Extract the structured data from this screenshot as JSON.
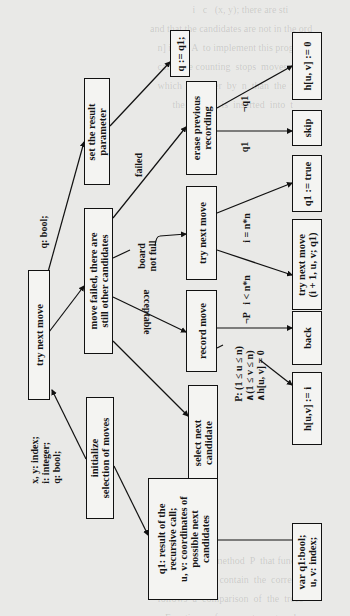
{
  "diagram": {
    "declarations": {
      "root_params": "q: bool;",
      "root_locals": "x, y: index;\ni: integer;\nq: bool;",
      "var_block": "var q1:bool;\nu, v: index;"
    },
    "nodes": {
      "root": "try next move",
      "init": "initialize\nselection of moves",
      "loop": "move failed, there are\nstill other candidates",
      "set_result": "set the result\nparameter",
      "assign_q": "q := q1;",
      "select": "select next\ncandidate",
      "record": "record move",
      "try_inner": "try next move",
      "erase": "erase previous\nrecording",
      "q1_note": "q1: result of the\nrecursive call;\nu, v: coordinates of\npossible next\ncandidates",
      "h_zero": "h[u, v] := 0",
      "skip": "skip",
      "q1_true": "q1 := true",
      "try_recursive": "try next move\n(i + 1, u, v; q1)",
      "back": "back",
      "h_assign": "h[u,v] := i",
      "var_decl": "var q1:bool;\nu, v: index;"
    },
    "edge_labels": {
      "failed": "failed",
      "board_not_full": "board\nnot full",
      "acceptable": "acceptable",
      "not_q1": "¬q1",
      "q1": "q1",
      "i_eq": "i = n*n",
      "i_lt": "i < n*n",
      "not_p": "¬P",
      "predicate_p": "P: (1 ≤ u ≤ n)\n∧(1 ≤ v ≤ n)\n∧h[u, v] = 0"
    },
    "bleed_text": "                 i   c   (x, y); there are sti\nand that the candidates are not in the ord\n   n] i = 1  A  to implement this program\n   calls  the counting  stops  moves  will\n   which  is  larger  by  n  than  the  row\n         the  key  K  is  inserted  into  t\n\n\n\n\n\n\n\n\n\n\n\n\n\n\n\n\n\n\n\n\n\n\n\nBy defining the method  P  that function\nwriteln  x  has to contain  the  corre\n   follows  a  comparison  of  the  trees\n      Functions  of  parameters  stored\n\n   a  given  table  (sub-tables  in  single\n   of  execution\n   method  of  EASP  Document  Test\n   the  user  selects  the  context  of\n     use  and  selects  items,  elements\n   code  generation\n   of  arithmetic  checks  for  overflow\n   to  the  solution  of  earlier  stage\n"
  }
}
